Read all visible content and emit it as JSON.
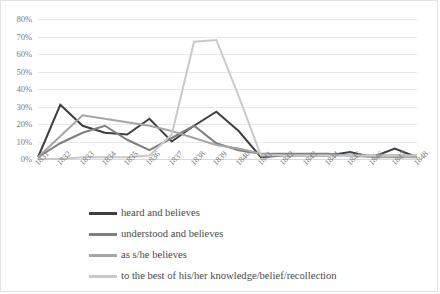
{
  "chart_data": {
    "type": "line",
    "title": "",
    "xlabel": "",
    "ylabel": "",
    "ylim": [
      0,
      80
    ],
    "ytick_labels": [
      "80%",
      "70%",
      "60%",
      "50%",
      "40%",
      "30%",
      "20%",
      "10%",
      "0%"
    ],
    "ytick_values": [
      80,
      70,
      60,
      50,
      40,
      30,
      20,
      10,
      0
    ],
    "grid": true,
    "legend_position": "bottom-left",
    "categories": [
      "1831",
      "1832",
      "1833",
      "1834",
      "1835",
      "1836",
      "1837",
      "1838",
      "1839",
      "1840",
      "1841",
      "1842",
      "1843",
      "1844",
      "1845",
      "1846",
      "1847",
      "1848"
    ],
    "series": [
      {
        "name": "heard and believes",
        "color": "#3f3f3f",
        "values": [
          1,
          31,
          19,
          15,
          14,
          23,
          10,
          19,
          27,
          16,
          1,
          2,
          2,
          2,
          4,
          1,
          6,
          1
        ]
      },
      {
        "name": "understood and believes",
        "color": "#7f7f7f",
        "values": [
          1,
          9,
          15,
          19,
          11,
          5,
          12,
          19,
          9,
          5,
          3,
          3,
          3,
          3,
          2,
          2,
          2,
          2
        ]
      },
      {
        "name": "as s/he believes",
        "color": "#a6a6a6",
        "values": [
          1,
          13,
          25,
          23,
          21,
          19,
          16,
          12,
          8,
          6,
          3,
          2,
          2,
          2,
          2,
          1,
          1,
          1
        ]
      },
      {
        "name": "to the best of his/her knowledge/belief/recollection",
        "color": "#c9c9c9",
        "values": [
          0,
          0,
          1,
          1,
          1,
          2,
          14,
          67,
          68,
          36,
          2,
          2,
          2,
          2,
          2,
          2,
          2,
          2
        ]
      }
    ]
  },
  "legend": {
    "items": [
      {
        "label": "heard and believes"
      },
      {
        "label": "understood and believes"
      },
      {
        "label": "as s/he believes"
      },
      {
        "label": "to the best of his/her knowledge/belief/recollection"
      }
    ]
  }
}
